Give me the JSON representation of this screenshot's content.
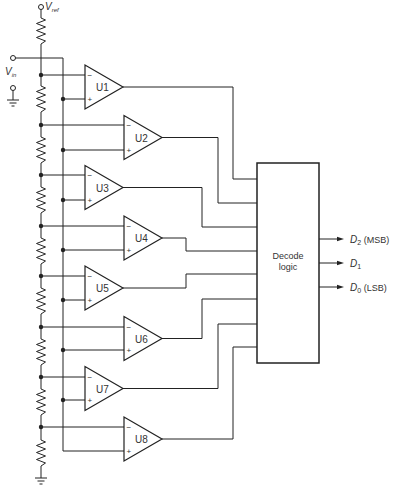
{
  "inputs": {
    "vref": {
      "symbol": "V",
      "subscript": "ref"
    },
    "vin": {
      "symbol": "V",
      "subscript": "in"
    }
  },
  "comparators": [
    {
      "label": "U1"
    },
    {
      "label": "U2"
    },
    {
      "label": "U3"
    },
    {
      "label": "U4"
    },
    {
      "label": "U5"
    },
    {
      "label": "U6"
    },
    {
      "label": "U7"
    },
    {
      "label": "U8"
    }
  ],
  "comparator_pins": {
    "inverting": "−",
    "non_inverting": "+"
  },
  "decoder": {
    "line1": "Decode",
    "line2": "logic"
  },
  "outputs": [
    {
      "symbol": "D",
      "subscript": "2",
      "note": " (MSB)"
    },
    {
      "symbol": "D",
      "subscript": "1",
      "note": ""
    },
    {
      "symbol": "D",
      "subscript": "0",
      "note": " (LSB)"
    }
  ],
  "structure": {
    "resistors": 9,
    "comparators": 8,
    "outputs": 3
  },
  "colors": {
    "stroke": "#222222",
    "background": "#ffffff",
    "text": "#333333"
  }
}
